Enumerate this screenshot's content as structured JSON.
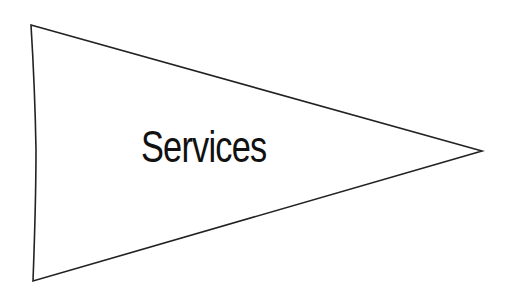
{
  "diagram": {
    "shape": "pennant-triangle",
    "label": "Services",
    "stroke_color": "#222222",
    "fill_color": "#ffffff",
    "text_color": "#111111",
    "vertices": [
      [
        31,
        25
      ],
      [
        482,
        151
      ],
      [
        33,
        281
      ]
    ],
    "left_edge_midpoint": [
      36,
      150
    ]
  }
}
